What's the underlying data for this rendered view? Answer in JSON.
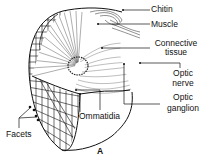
{
  "figure": {
    "panel_label": "A",
    "labels": {
      "chitin": "Chitin",
      "muscle": "Muscle",
      "connective_1": "Connective",
      "connective_2": "tissue",
      "optic_nerve_1": "Optic",
      "optic_nerve_2": "nerve",
      "optic_ganglion_1": "Optic",
      "optic_ganglion_2": "ganglion",
      "ommatidia": "Ommatidia",
      "facets": "Facets"
    }
  }
}
